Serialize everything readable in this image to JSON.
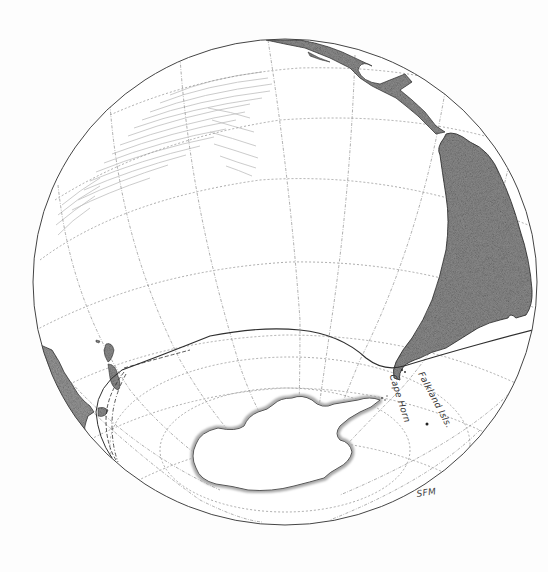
{
  "map": {
    "type": "orthographic globe illustration (hand-drawn)",
    "labels": {
      "cape_horn": "Cape Horn",
      "falkland_islands": "Falkland Isls.",
      "signature": "SFM"
    },
    "features": [
      {
        "name": "South America",
        "kind": "landmass",
        "fill": "#8f8f8f"
      },
      {
        "name": "Central America / Mexico",
        "kind": "landmass",
        "fill": "#8f8f8f"
      },
      {
        "name": "Antarctica",
        "kind": "landmass-ice",
        "fill": "#ffffff",
        "edge": "#a8a8a8"
      },
      {
        "name": "Australia (east coast)",
        "kind": "landmass",
        "fill": "#9a9a9a"
      },
      {
        "name": "New Zealand",
        "kind": "islands",
        "fill": "#8f8f8f"
      },
      {
        "name": "Tasmania",
        "kind": "island",
        "fill": "#8f8f8f"
      },
      {
        "name": "Route line",
        "kind": "track",
        "description": "Route from New Zealand across the Southern Ocean to Cape Horn and into the Atlantic"
      },
      {
        "name": "Falkland Islands",
        "kind": "point-marker"
      },
      {
        "name": "Pacific hatching",
        "kind": "shading"
      }
    ],
    "colors": {
      "background": "#fdfdfd",
      "globe_outline": "#444444",
      "graticule": "#8a8a8a",
      "land": "#8f8f8f",
      "land_edge": "#3a3a3a",
      "hatch": "#b5b5b5",
      "route": "#2f2f2f"
    }
  }
}
